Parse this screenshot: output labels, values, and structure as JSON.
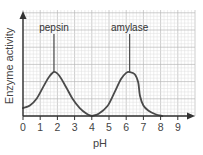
{
  "chart_data": {
    "type": "line",
    "title": "",
    "xlabel": "pH",
    "ylabel": "Enzyme activity",
    "xlim": [
      0,
      10
    ],
    "ylim": [
      0,
      1.4
    ],
    "x_ticks": [
      0,
      1,
      2,
      3,
      4,
      5,
      6,
      7,
      8,
      9
    ],
    "y_ticks": [],
    "grid": true,
    "legend": "none",
    "series": [
      {
        "name": "pepsin",
        "label": "pepsin",
        "optimum_pH": 1.8,
        "points": [
          [
            0,
            0.18
          ],
          [
            0.4,
            0.24
          ],
          [
            0.8,
            0.4
          ],
          [
            1.2,
            0.68
          ],
          [
            1.5,
            0.88
          ],
          [
            1.8,
            1.0
          ],
          [
            2.1,
            0.92
          ],
          [
            2.5,
            0.66
          ],
          [
            2.9,
            0.38
          ],
          [
            3.3,
            0.18
          ],
          [
            3.7,
            0.05
          ],
          [
            4.0,
            0.0
          ]
        ]
      },
      {
        "name": "amylase",
        "label": "amylase",
        "optimum_pH": 6.2,
        "points": [
          [
            4.0,
            0.0
          ],
          [
            4.4,
            0.05
          ],
          [
            4.9,
            0.22
          ],
          [
            5.3,
            0.52
          ],
          [
            5.7,
            0.84
          ],
          [
            6.0,
            0.98
          ],
          [
            6.2,
            1.0
          ],
          [
            6.5,
            0.95
          ],
          [
            6.7,
            0.76
          ],
          [
            6.8,
            0.46
          ],
          [
            7.0,
            0.24
          ],
          [
            7.3,
            0.12
          ],
          [
            7.7,
            0.04
          ],
          [
            8.1,
            0.0
          ]
        ]
      }
    ],
    "annotations": [
      {
        "text": "pepsin",
        "x": 1.8,
        "points_to": "peak"
      },
      {
        "text": "amylase",
        "x": 6.2,
        "points_to": "peak"
      }
    ]
  },
  "colors": {
    "curve": "#4a4a4a",
    "axis": "#333333",
    "grid_major": "#b8b8b8",
    "grid_minor": "#dedede"
  }
}
